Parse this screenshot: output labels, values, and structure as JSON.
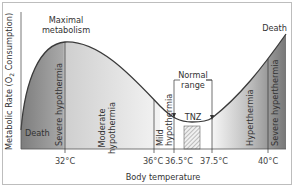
{
  "figure": {
    "y_axis_label": "Metabolic Rate (O2 Consumption)",
    "y_axis_label_prefix": "Metabolic Rate (O",
    "y_axis_label_sub": "2",
    "y_axis_label_suffix": " Consumption)",
    "x_axis_label": "Body temperature",
    "annotations": {
      "maximal_line1": "Maximal",
      "maximal_line2": "metabolism",
      "death_left": "Death",
      "death_right": "Death",
      "normal_line1": "Normal",
      "normal_line2": "range",
      "tnz": "TNZ"
    },
    "zones": {
      "severe_hypothermia": "Severe hypothermia",
      "moderate_line1": "Moderate",
      "moderate_line2": "hypothermia",
      "mild_line1": "Mild",
      "mild_line2": "hypothermia",
      "hyperthermia": "Hyperthermia",
      "severe_hyperthermia": "Severe hyperthermia"
    },
    "ticks": [
      "32°C",
      "36°C",
      "36.5°C",
      "37.5°C",
      "40°C"
    ],
    "colors": {
      "dark_zone": "#8a8a8a",
      "mid_zone": "#c4c4c4",
      "light_zone": "#ececec",
      "curve": "#3a3a3a"
    }
  }
}
